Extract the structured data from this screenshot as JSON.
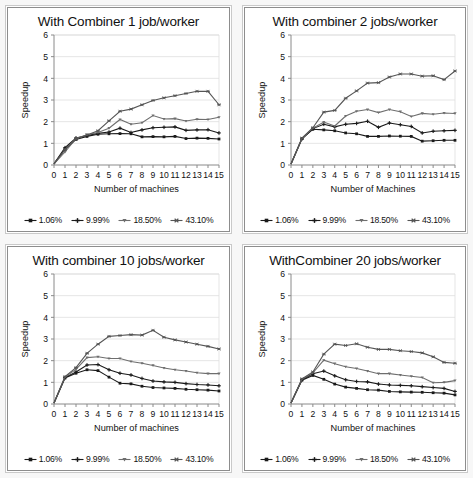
{
  "figure": {
    "background": "#fdfdfd",
    "panel_background": "#ffffff",
    "panel_count": 4
  },
  "legend_common": {
    "entries": [
      {
        "label": "1.06%",
        "marker": "filled-square",
        "color": "#1a1a1a"
      },
      {
        "label": "9.99%",
        "marker": "filled-cross",
        "color": "#1a1a1a"
      },
      {
        "label": "18.50%",
        "marker": "small-tri-down",
        "color": "#6e6e6e"
      },
      {
        "label": "43.10%",
        "marker": "star-asterisk",
        "color": "#555555"
      }
    ]
  },
  "axes_common": {
    "ylabel": "Speedup",
    "yticks": [
      0,
      1,
      2,
      3,
      4,
      5,
      6
    ],
    "ylim": [
      0,
      6
    ],
    "xticks": [
      0,
      1,
      2,
      3,
      4,
      5,
      6,
      7,
      8,
      9,
      10,
      11,
      12,
      13,
      14,
      15
    ],
    "xlim": [
      0,
      15
    ],
    "grid": "horizontal"
  },
  "chart_data": [
    {
      "type": "line",
      "panel": "top-left",
      "title": "With Combiner 1 job/worker",
      "xlabel": "Number of machines",
      "ylabel": "Speedup",
      "xlim": [
        0,
        15
      ],
      "ylim": [
        0,
        6
      ],
      "grid": true,
      "legend_position": "below-axis",
      "x": [
        0,
        1,
        2,
        3,
        4,
        5,
        6,
        7,
        8,
        9,
        10,
        11,
        12,
        13,
        14,
        15
      ],
      "series": [
        {
          "name": "1.06%",
          "values": [
            0.05,
            0.72,
            1.18,
            1.32,
            1.42,
            1.44,
            1.45,
            1.44,
            1.3,
            1.31,
            1.3,
            1.32,
            1.22,
            1.24,
            1.23,
            1.2
          ]
        },
        {
          "name": "9.99%",
          "values": [
            0.05,
            0.8,
            1.25,
            1.36,
            1.46,
            1.52,
            1.7,
            1.5,
            1.62,
            1.72,
            1.74,
            1.76,
            1.6,
            1.62,
            1.63,
            1.48
          ]
        },
        {
          "name": "18.50%",
          "values": [
            0.05,
            0.6,
            1.22,
            1.4,
            1.5,
            1.7,
            2.1,
            1.88,
            1.95,
            2.28,
            2.12,
            2.14,
            2.03,
            2.11,
            2.1,
            2.2
          ]
        },
        {
          "name": "43.10%",
          "values": [
            0.05,
            0.72,
            1.2,
            1.38,
            1.58,
            2.04,
            2.48,
            2.58,
            2.78,
            2.98,
            3.1,
            3.2,
            3.3,
            3.4,
            3.4,
            2.78
          ]
        }
      ]
    },
    {
      "type": "line",
      "panel": "top-right",
      "title": "With combiner 2 jobs/worker",
      "xlabel": "Number of Machines",
      "ylabel": "Speedup",
      "xlim": [
        0,
        15
      ],
      "ylim": [
        0,
        6
      ],
      "grid": true,
      "legend_position": "below-axis",
      "x": [
        0,
        1,
        2,
        3,
        4,
        5,
        6,
        7,
        8,
        9,
        10,
        11,
        12,
        13,
        14,
        15
      ],
      "series": [
        {
          "name": "1.06%",
          "values": [
            0.05,
            1.22,
            1.65,
            1.62,
            1.58,
            1.48,
            1.44,
            1.32,
            1.32,
            1.34,
            1.33,
            1.32,
            1.1,
            1.12,
            1.14,
            1.14
          ]
        },
        {
          "name": "9.99%",
          "values": [
            0.05,
            1.2,
            1.68,
            1.88,
            1.76,
            1.88,
            1.92,
            2.02,
            1.74,
            1.94,
            1.86,
            1.78,
            1.48,
            1.56,
            1.58,
            1.6
          ]
        },
        {
          "name": "18.50%",
          "values": [
            0.05,
            1.22,
            1.7,
            1.98,
            1.8,
            2.26,
            2.48,
            2.56,
            2.42,
            2.56,
            2.46,
            2.24,
            2.38,
            2.34,
            2.4,
            2.38
          ]
        },
        {
          "name": "43.10%",
          "values": [
            0.05,
            1.24,
            1.72,
            2.44,
            2.52,
            3.08,
            3.42,
            3.78,
            3.8,
            4.06,
            4.2,
            4.2,
            4.1,
            4.12,
            3.94,
            4.34
          ]
        }
      ]
    },
    {
      "type": "line",
      "panel": "bottom-left",
      "title": "With combiner 10 jobs/worker",
      "xlabel": "Number of machines",
      "ylabel": "Speedup",
      "xlim": [
        0,
        15
      ],
      "ylim": [
        0,
        6
      ],
      "grid": true,
      "legend_position": "below-axis",
      "x": [
        0,
        1,
        2,
        3,
        4,
        5,
        6,
        7,
        8,
        9,
        10,
        11,
        12,
        13,
        14,
        15
      ],
      "series": [
        {
          "name": "1.06%",
          "values": [
            0.05,
            1.2,
            1.42,
            1.58,
            1.54,
            1.24,
            0.96,
            0.93,
            0.82,
            0.76,
            0.74,
            0.72,
            0.68,
            0.66,
            0.64,
            0.6
          ]
        },
        {
          "name": "9.99%",
          "values": [
            0.05,
            1.22,
            1.48,
            1.8,
            1.82,
            1.58,
            1.42,
            1.34,
            1.18,
            1.06,
            1.02,
            1.0,
            0.94,
            0.9,
            0.88,
            0.84
          ]
        },
        {
          "name": "18.50%",
          "values": [
            0.05,
            1.24,
            1.6,
            2.14,
            2.18,
            2.1,
            2.1,
            1.96,
            1.88,
            1.78,
            1.66,
            1.58,
            1.52,
            1.44,
            1.4,
            1.4
          ]
        },
        {
          "name": "43.10%",
          "values": [
            0.05,
            1.26,
            1.68,
            2.34,
            2.76,
            3.12,
            3.16,
            3.2,
            3.18,
            3.4,
            3.08,
            2.96,
            2.86,
            2.76,
            2.66,
            2.54
          ]
        }
      ]
    },
    {
      "type": "line",
      "panel": "bottom-right",
      "title": "WithCombiner 20 jobs/worker",
      "xlabel": "Number of machines",
      "ylabel": "Speedup",
      "xlim": [
        0,
        15
      ],
      "ylim": [
        0,
        6
      ],
      "grid": true,
      "legend_position": "below-axis",
      "x": [
        0,
        1,
        2,
        3,
        4,
        5,
        6,
        7,
        8,
        9,
        10,
        11,
        12,
        13,
        14,
        15
      ],
      "series": [
        {
          "name": "1.06%",
          "values": [
            0.05,
            1.1,
            1.32,
            1.14,
            0.92,
            0.78,
            0.72,
            0.66,
            0.64,
            0.58,
            0.56,
            0.55,
            0.54,
            0.52,
            0.5,
            0.42
          ]
        },
        {
          "name": "9.99%",
          "values": [
            0.05,
            1.12,
            1.4,
            1.52,
            1.3,
            1.12,
            1.04,
            1.02,
            0.92,
            0.88,
            0.86,
            0.84,
            0.8,
            0.76,
            0.72,
            0.58
          ]
        },
        {
          "name": "18.50%",
          "values": [
            0.05,
            1.14,
            1.44,
            2.02,
            1.86,
            1.72,
            1.64,
            1.52,
            1.4,
            1.4,
            1.34,
            1.28,
            1.22,
            0.98,
            1.0,
            1.08
          ]
        },
        {
          "name": "43.10%",
          "values": [
            0.05,
            1.16,
            1.48,
            2.3,
            2.76,
            2.7,
            2.78,
            2.62,
            2.52,
            2.52,
            2.46,
            2.42,
            2.36,
            2.18,
            1.92,
            1.88
          ]
        }
      ]
    }
  ]
}
